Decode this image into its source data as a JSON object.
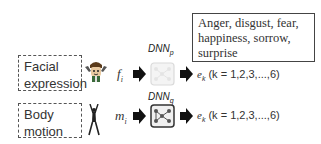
{
  "emotions_box": {
    "text_line1": "Anger, disgust, fear,",
    "text_line2": "happiness, sorrow,",
    "text_line3": "surprise"
  },
  "rows": [
    {
      "input_label_line1": "Facial",
      "input_label_line2": "expression",
      "icon": "face-icon",
      "variable": "f",
      "variable_sub": "i",
      "network": "DNN",
      "network_sub": "p",
      "output_var": "e",
      "output_sub": "k",
      "output_range": " (k = 1,2,3,...,6)"
    },
    {
      "input_label_line1": "Body",
      "input_label_line2": "motion",
      "icon": "body-figure-icon",
      "variable": "m",
      "variable_sub": "i",
      "network": "DNN",
      "network_sub": "q",
      "output_var": "e",
      "output_sub": "k",
      "output_range": " (k = 1,2,3,...,6)"
    }
  ],
  "colors": {
    "arrow": "#111111",
    "dashed_border": "#555555",
    "dnn_p_faded": "#d8d8d8",
    "dnn_q": "#333333"
  }
}
